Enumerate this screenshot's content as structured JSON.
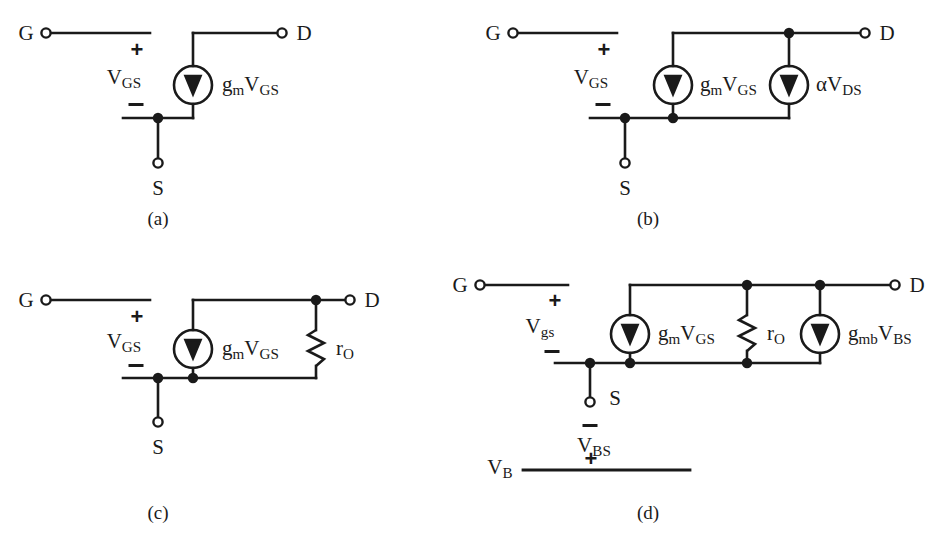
{
  "figure": {
    "background_color": "#ffffff",
    "ink_color": "#1a1a1a",
    "width": 935,
    "height": 534
  },
  "panels": [
    {
      "id": "a",
      "caption": "(a)",
      "terminals": [
        "G",
        "D",
        "S"
      ],
      "gate_label": "G",
      "drain_label": "D",
      "source_label": "S",
      "plus_sign": "+",
      "minus_sign": "−",
      "port_voltage": {
        "base": "V",
        "sub": "GS"
      },
      "elements": [
        {
          "kind": "current-source",
          "base": "g",
          "sub1": "m",
          "base2": "V",
          "sub2": "GS",
          "direction": "down"
        }
      ]
    },
    {
      "id": "b",
      "caption": "(b)",
      "terminals": [
        "G",
        "D",
        "S"
      ],
      "gate_label": "G",
      "drain_label": "D",
      "source_label": "S",
      "plus_sign": "+",
      "minus_sign": "−",
      "port_voltage": {
        "base": "V",
        "sub": "GS"
      },
      "elements": [
        {
          "kind": "current-source",
          "base": "g",
          "sub1": "m",
          "base2": "V",
          "sub2": "GS",
          "direction": "down"
        },
        {
          "kind": "current-source",
          "base": "α",
          "sub1": "",
          "base2": "V",
          "sub2": "DS",
          "direction": "down"
        }
      ]
    },
    {
      "id": "c",
      "caption": "(c)",
      "terminals": [
        "G",
        "D",
        "S"
      ],
      "gate_label": "G",
      "drain_label": "D",
      "source_label": "S",
      "plus_sign": "+",
      "minus_sign": "−",
      "port_voltage": {
        "base": "V",
        "sub": "GS"
      },
      "elements": [
        {
          "kind": "current-source",
          "base": "g",
          "sub1": "m",
          "base2": "V",
          "sub2": "GS",
          "direction": "down"
        },
        {
          "kind": "resistor",
          "base": "r",
          "sub1": "O"
        }
      ]
    },
    {
      "id": "d",
      "caption": "(d)",
      "terminals": [
        "G",
        "D",
        "S",
        "V_B"
      ],
      "gate_label": "G",
      "drain_label": "D",
      "source_label": "S",
      "body_label": {
        "base": "V",
        "sub": "B"
      },
      "plus_sign": "+",
      "minus_sign": "−",
      "port_voltage": {
        "base": "V",
        "sub": "gs"
      },
      "body_voltage": {
        "base": "V",
        "sub": "BS"
      },
      "body_plus_sign": "+",
      "body_minus_sign": "−",
      "elements": [
        {
          "kind": "current-source",
          "base": "g",
          "sub1": "m",
          "base2": "V",
          "sub2": "GS",
          "direction": "down"
        },
        {
          "kind": "resistor",
          "base": "r",
          "sub1": "O"
        },
        {
          "kind": "current-source",
          "base": "g",
          "sub1": "mb",
          "base2": "V",
          "sub2": "BS",
          "direction": "down"
        }
      ]
    }
  ],
  "labels": {
    "G": "G",
    "D": "D",
    "S": "S",
    "plus": "+",
    "minus": "−",
    "alpha": "α",
    "gm_g": "g",
    "gm_m": "m",
    "gmb_mb": "mb",
    "V": "V",
    "GS": "GS",
    "gs": "gs",
    "DS": "DS",
    "BS": "BS",
    "B": "B",
    "r": "r",
    "O": "O",
    "caption_a": "(a)",
    "caption_b": "(b)",
    "caption_c": "(c)",
    "caption_d": "(d)"
  }
}
